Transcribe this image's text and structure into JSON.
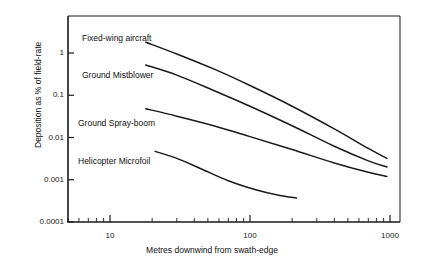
{
  "chart_data": {
    "type": "line",
    "title": "",
    "xlabel": "Metres downwind from swath-edge",
    "ylabel": "Deposition as % of field-rate",
    "xscale": "log",
    "yscale": "log",
    "xlim": [
      5,
      1300
    ],
    "ylim": [
      0.0001,
      3.2
    ],
    "grid": false,
    "legend": "inline-labels",
    "xticks": [
      {
        "value": 10,
        "label": "10"
      },
      {
        "value": 100,
        "label": "100"
      },
      {
        "value": 1000,
        "label": "1000"
      }
    ],
    "yticks": [
      {
        "value": 1,
        "label": "1"
      },
      {
        "value": 0.1,
        "label": "0.1"
      },
      {
        "value": 0.01,
        "label": "0.01"
      },
      {
        "value": 0.001,
        "label": "0.001"
      },
      {
        "value": 0.0001,
        "label": "0.0001"
      }
    ],
    "series": [
      {
        "name": "Fixed-wing aircraft",
        "points": [
          {
            "x": 18,
            "y": 1.8
          },
          {
            "x": 30,
            "y": 0.95
          },
          {
            "x": 55,
            "y": 0.42
          },
          {
            "x": 100,
            "y": 0.17
          },
          {
            "x": 200,
            "y": 0.055
          },
          {
            "x": 400,
            "y": 0.016
          },
          {
            "x": 700,
            "y": 0.0055
          },
          {
            "x": 950,
            "y": 0.0032
          }
        ]
      },
      {
        "name": "Ground Mistblower",
        "points": [
          {
            "x": 18,
            "y": 0.52
          },
          {
            "x": 30,
            "y": 0.3
          },
          {
            "x": 55,
            "y": 0.13
          },
          {
            "x": 100,
            "y": 0.055
          },
          {
            "x": 200,
            "y": 0.019
          },
          {
            "x": 400,
            "y": 0.0062
          },
          {
            "x": 700,
            "y": 0.0028
          },
          {
            "x": 950,
            "y": 0.002
          }
        ]
      },
      {
        "name": "Ground Spray-boom",
        "points": [
          {
            "x": 18,
            "y": 0.048
          },
          {
            "x": 30,
            "y": 0.032
          },
          {
            "x": 55,
            "y": 0.019
          },
          {
            "x": 100,
            "y": 0.0105
          },
          {
            "x": 200,
            "y": 0.0052
          },
          {
            "x": 400,
            "y": 0.0025
          },
          {
            "x": 700,
            "y": 0.0015
          },
          {
            "x": 950,
            "y": 0.0012
          }
        ]
      },
      {
        "name": "Helicopter Microfoil",
        "points": [
          {
            "x": 21,
            "y": 0.0047
          },
          {
            "x": 30,
            "y": 0.0032
          },
          {
            "x": 45,
            "y": 0.0018
          },
          {
            "x": 70,
            "y": 0.00095
          },
          {
            "x": 110,
            "y": 0.00058
          },
          {
            "x": 160,
            "y": 0.00043
          },
          {
            "x": 215,
            "y": 0.00037
          }
        ]
      }
    ],
    "series_labels": [
      {
        "text": "Fixed-wing aircraft",
        "left": 82,
        "top": 33
      },
      {
        "text": "Ground Mistblower",
        "left": 82,
        "top": 70
      },
      {
        "text": "Ground Spray-boom",
        "left": 78,
        "top": 118
      },
      {
        "text": "Helicopter Microfoil",
        "left": 78,
        "top": 156
      }
    ],
    "colors": {
      "line": "#1a1a1a",
      "axis": "#1a1a1a",
      "text": "#111111",
      "background": "#ffffff"
    }
  }
}
